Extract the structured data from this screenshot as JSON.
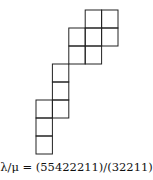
{
  "diagram": {
    "type": "skew-young-diagram",
    "cell_width": 16.4,
    "cell_height": 18,
    "origin_x": 36,
    "origin_y": 10,
    "rows": [
      {
        "start_col": 3,
        "length": 2
      },
      {
        "start_col": 2,
        "length": 3
      },
      {
        "start_col": 2,
        "length": 2
      },
      {
        "start_col": 1,
        "length": 1
      },
      {
        "start_col": 1,
        "length": 1
      },
      {
        "start_col": 0,
        "length": 2
      },
      {
        "start_col": 0,
        "length": 1
      },
      {
        "start_col": 0,
        "length": 1
      }
    ],
    "line_color": "#222222"
  },
  "caption": "λ/μ = (55422211)/(32211)"
}
